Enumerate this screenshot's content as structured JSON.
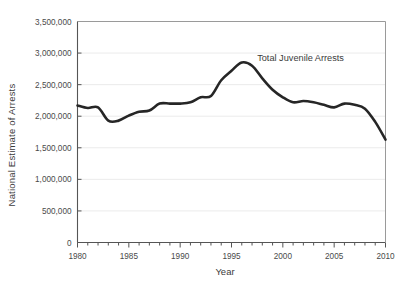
{
  "chart_data": {
    "type": "line",
    "title": "",
    "xlabel": "Year",
    "ylabel": "National Estimate of Arrests",
    "xlim": [
      1980,
      2010
    ],
    "ylim": [
      0,
      3500000
    ],
    "grid": true,
    "legend_position": "inline-annotation",
    "annotations": [
      {
        "text": "Total Juvenile Arrests",
        "x": 1997.5,
        "y": 2870000
      }
    ],
    "x_tick_labels": [
      "1980",
      "1985",
      "1990",
      "1995",
      "2000",
      "2005",
      "2010"
    ],
    "x_tick_values": [
      1980,
      1985,
      1990,
      1995,
      2000,
      2005,
      2010
    ],
    "x_minor_tick_step": 1,
    "y_tick_labels": [
      "0",
      "500,000",
      "1,000,000",
      "1,500,000",
      "2,000,000",
      "2,500,000",
      "3,000,000",
      "3,500,000"
    ],
    "y_tick_values": [
      0,
      500000,
      1000000,
      1500000,
      2000000,
      2500000,
      3000000,
      3500000
    ],
    "series": [
      {
        "name": "Total Juvenile Arrests",
        "color": "#262626",
        "x": [
          1980,
          1981,
          1982,
          1983,
          1984,
          1985,
          1986,
          1987,
          1988,
          1989,
          1990,
          1991,
          1992,
          1993,
          1994,
          1995,
          1996,
          1997,
          1998,
          1999,
          2000,
          2001,
          2002,
          2003,
          2004,
          2005,
          2006,
          2007,
          2008,
          2009,
          2010
        ],
        "values": [
          2170000,
          2130000,
          2140000,
          1930000,
          1930000,
          2010000,
          2070000,
          2090000,
          2200000,
          2200000,
          2200000,
          2220000,
          2300000,
          2320000,
          2570000,
          2720000,
          2850000,
          2800000,
          2600000,
          2420000,
          2300000,
          2220000,
          2240000,
          2220000,
          2180000,
          2140000,
          2200000,
          2180000,
          2120000,
          1910000,
          1630000
        ]
      }
    ]
  },
  "axis_label_x": "Year",
  "axis_label_y": "National Estimate of Arrests"
}
